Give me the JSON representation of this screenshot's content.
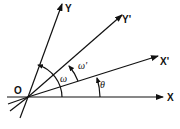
{
  "diagram": {
    "origin": {
      "label": "O",
      "x": 28,
      "y": 97
    },
    "axes": [
      {
        "id": "X",
        "label": "X",
        "angle_deg": 0
      },
      {
        "id": "Xp",
        "label": "X'",
        "angle_deg": 15
      },
      {
        "id": "Yp",
        "label": "Y'",
        "angle_deg": 35
      },
      {
        "id": "Y",
        "label": "Y",
        "angle_deg": 70
      }
    ],
    "angles": [
      {
        "label": "ω",
        "from": "X",
        "to": "Y"
      },
      {
        "label": "ω'",
        "from": "Xp",
        "to": "Yp"
      },
      {
        "label": "θ",
        "from": "X",
        "to": "Xp"
      }
    ],
    "colors": {
      "stroke": "#111111",
      "background": "#ffffff"
    }
  }
}
